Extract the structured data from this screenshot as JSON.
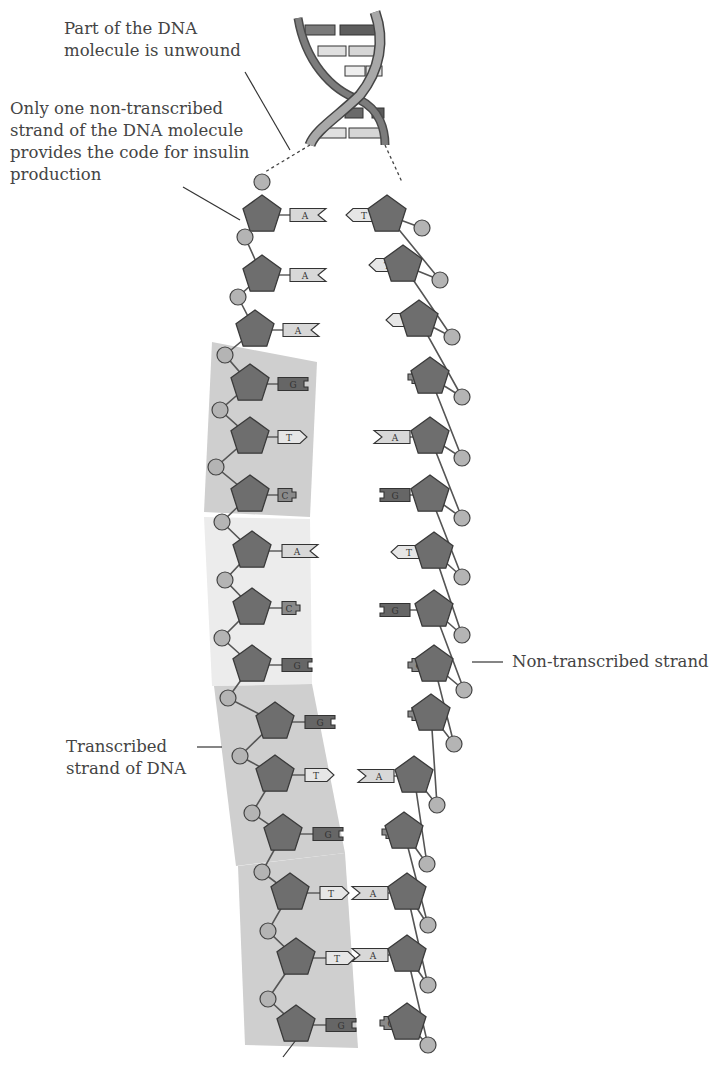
{
  "labels": {
    "unwound": [
      "Part of the DNA",
      "molecule is unwound"
    ],
    "one_strand": [
      "Only one non-transcribed",
      "strand of the DNA molecule",
      "provides the code for insulin",
      "production"
    ],
    "non_transcribed": "Non-transcribed strand",
    "transcribed": [
      "Transcribed",
      "strand of DNA"
    ]
  },
  "colors": {
    "sugar": "#6e6e6e",
    "phosphate": "#b4b4b4",
    "backbone": "#555555",
    "base_A": "#d8d8d8",
    "base_T": "#e6e6e6",
    "base_G": "#666666",
    "base_C": "#8a8a8a",
    "codon_block_light": "#ececec",
    "codon_block_dark": "#cfcfcf"
  },
  "left_strand": [
    {
      "x": 262,
      "y": 215,
      "base": "A",
      "bx": 290
    },
    {
      "x": 262,
      "y": 275,
      "base": "A",
      "bx": 290
    },
    {
      "x": 255,
      "y": 330,
      "base": "A",
      "bx": 283
    },
    {
      "x": 250,
      "y": 384,
      "base": "G",
      "bx": 278
    },
    {
      "x": 250,
      "y": 437,
      "base": "T",
      "bx": 278
    },
    {
      "x": 250,
      "y": 495,
      "base": "C",
      "bx": 278
    },
    {
      "x": 252,
      "y": 551,
      "base": "A",
      "bx": 282
    },
    {
      "x": 252,
      "y": 608,
      "base": "C",
      "bx": 282
    },
    {
      "x": 252,
      "y": 665,
      "base": "G",
      "bx": 282
    },
    {
      "x": 275,
      "y": 722,
      "base": "G",
      "bx": 305
    },
    {
      "x": 275,
      "y": 775,
      "base": "T",
      "bx": 305
    },
    {
      "x": 283,
      "y": 834,
      "base": "G",
      "bx": 313
    },
    {
      "x": 290,
      "y": 893,
      "base": "T",
      "bx": 320
    },
    {
      "x": 296,
      "y": 958,
      "base": "T",
      "bx": 326
    },
    {
      "x": 296,
      "y": 1025,
      "base": "G",
      "bx": 326
    }
  ],
  "left_phosphates": [
    {
      "x": 262,
      "y": 182
    },
    {
      "x": 245,
      "y": 237
    },
    {
      "x": 238,
      "y": 297
    },
    {
      "x": 225,
      "y": 355
    },
    {
      "x": 220,
      "y": 410
    },
    {
      "x": 216,
      "y": 467
    },
    {
      "x": 222,
      "y": 522
    },
    {
      "x": 225,
      "y": 580
    },
    {
      "x": 222,
      "y": 638
    },
    {
      "x": 228,
      "y": 698
    },
    {
      "x": 240,
      "y": 756
    },
    {
      "x": 252,
      "y": 813
    },
    {
      "x": 262,
      "y": 872
    },
    {
      "x": 268,
      "y": 931
    },
    {
      "x": 268,
      "y": 999
    }
  ],
  "right_strand": [
    {
      "x": 387,
      "y": 215,
      "base": "T",
      "bx": 345
    },
    {
      "x": 403,
      "y": 265,
      "base": "T",
      "bx": 368
    },
    {
      "x": 419,
      "y": 320,
      "base": "T",
      "bx": 385
    },
    {
      "x": 430,
      "y": 377,
      "base": "C",
      "bx": 396
    },
    {
      "x": 430,
      "y": 437,
      "base": "A",
      "bx": 380
    },
    {
      "x": 430,
      "y": 495,
      "base": "G",
      "bx": 380
    },
    {
      "x": 434,
      "y": 552,
      "base": "T",
      "bx": 390
    },
    {
      "x": 434,
      "y": 610,
      "base": "G",
      "bx": 380
    },
    {
      "x": 434,
      "y": 665,
      "base": "C",
      "bx": 396
    },
    {
      "x": 431,
      "y": 714,
      "base": "C",
      "bx": 396
    },
    {
      "x": 414,
      "y": 776,
      "base": "A",
      "bx": 364
    },
    {
      "x": 404,
      "y": 832,
      "base": "C",
      "bx": 370
    },
    {
      "x": 407,
      "y": 893,
      "base": "A",
      "bx": 358
    },
    {
      "x": 407,
      "y": 955,
      "base": "A",
      "bx": 358
    },
    {
      "x": 407,
      "y": 1023,
      "base": "C",
      "bx": 368
    }
  ],
  "right_phosphates": [
    {
      "x": 422,
      "y": 228
    },
    {
      "x": 440,
      "y": 280
    },
    {
      "x": 452,
      "y": 337
    },
    {
      "x": 462,
      "y": 397
    },
    {
      "x": 462,
      "y": 458
    },
    {
      "x": 462,
      "y": 518
    },
    {
      "x": 462,
      "y": 577
    },
    {
      "x": 462,
      "y": 635
    },
    {
      "x": 464,
      "y": 690
    },
    {
      "x": 454,
      "y": 744
    },
    {
      "x": 437,
      "y": 805
    },
    {
      "x": 427,
      "y": 864
    },
    {
      "x": 428,
      "y": 925
    },
    {
      "x": 428,
      "y": 985
    },
    {
      "x": 428,
      "y": 1045
    }
  ],
  "codon_blocks": [
    {
      "points": "212,342 317,362 310,517 204,512",
      "tone": "dark"
    },
    {
      "points": "204,517 310,519 312,684 212,686",
      "tone": "light"
    },
    {
      "points": "214,686 312,684 345,853 236,866",
      "tone": "dark"
    },
    {
      "points": "238,866 345,853 358,1048 245,1045",
      "tone": "dark"
    }
  ]
}
